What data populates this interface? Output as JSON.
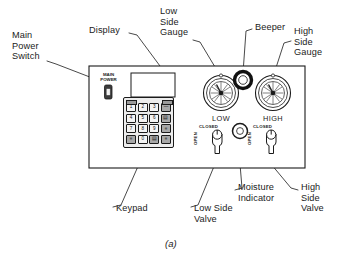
{
  "figure": {
    "caption": "(a)"
  },
  "callouts": [
    {
      "key": "main_power_switch",
      "label": "Main\nPower\nSwitch"
    },
    {
      "key": "display",
      "label": "Display"
    },
    {
      "key": "low_side_gauge",
      "label": "Low\nSide\nGauge"
    },
    {
      "key": "beeper",
      "label": "Beeper"
    },
    {
      "key": "high_side_gauge",
      "label": "High\nSide\nGauge"
    },
    {
      "key": "keypad",
      "label": "Keypad"
    },
    {
      "key": "low_side_valve",
      "label": "Low Side\nValve"
    },
    {
      "key": "moisture_indicator",
      "label": "Moisture\nIndicator"
    },
    {
      "key": "high_side_valve",
      "label": "High\nSide\nValve"
    }
  ],
  "panel": {
    "main_power_label": "MAIN\nPOWER",
    "gauges": [
      {
        "key": "low",
        "label": "LOW"
      },
      {
        "key": "high",
        "label": "HIGH"
      }
    ],
    "valves": [
      {
        "key": "low_side",
        "closed_label": "CLOSED",
        "open_label": "OPEN"
      },
      {
        "key": "high_side",
        "closed_label": "CLOSED",
        "open_label": "OPEN"
      }
    ],
    "display_value": "",
    "keypad": {
      "rows": [
        [
          "1",
          "2",
          "3",
          "—"
        ],
        [
          "4",
          "5",
          "6",
          "▤"
        ],
        [
          "7",
          "8",
          "9",
          "≡"
        ],
        [
          "≡",
          "0",
          "▤",
          "≡"
        ]
      ],
      "corner_top_left": "≡",
      "corner_top_right": "≡"
    }
  },
  "colors": {
    "ink": "#1b1b1b",
    "panel_fill": "#ffffff",
    "key_fill": "#e8e8e8",
    "beeper_ring": "#111111"
  }
}
